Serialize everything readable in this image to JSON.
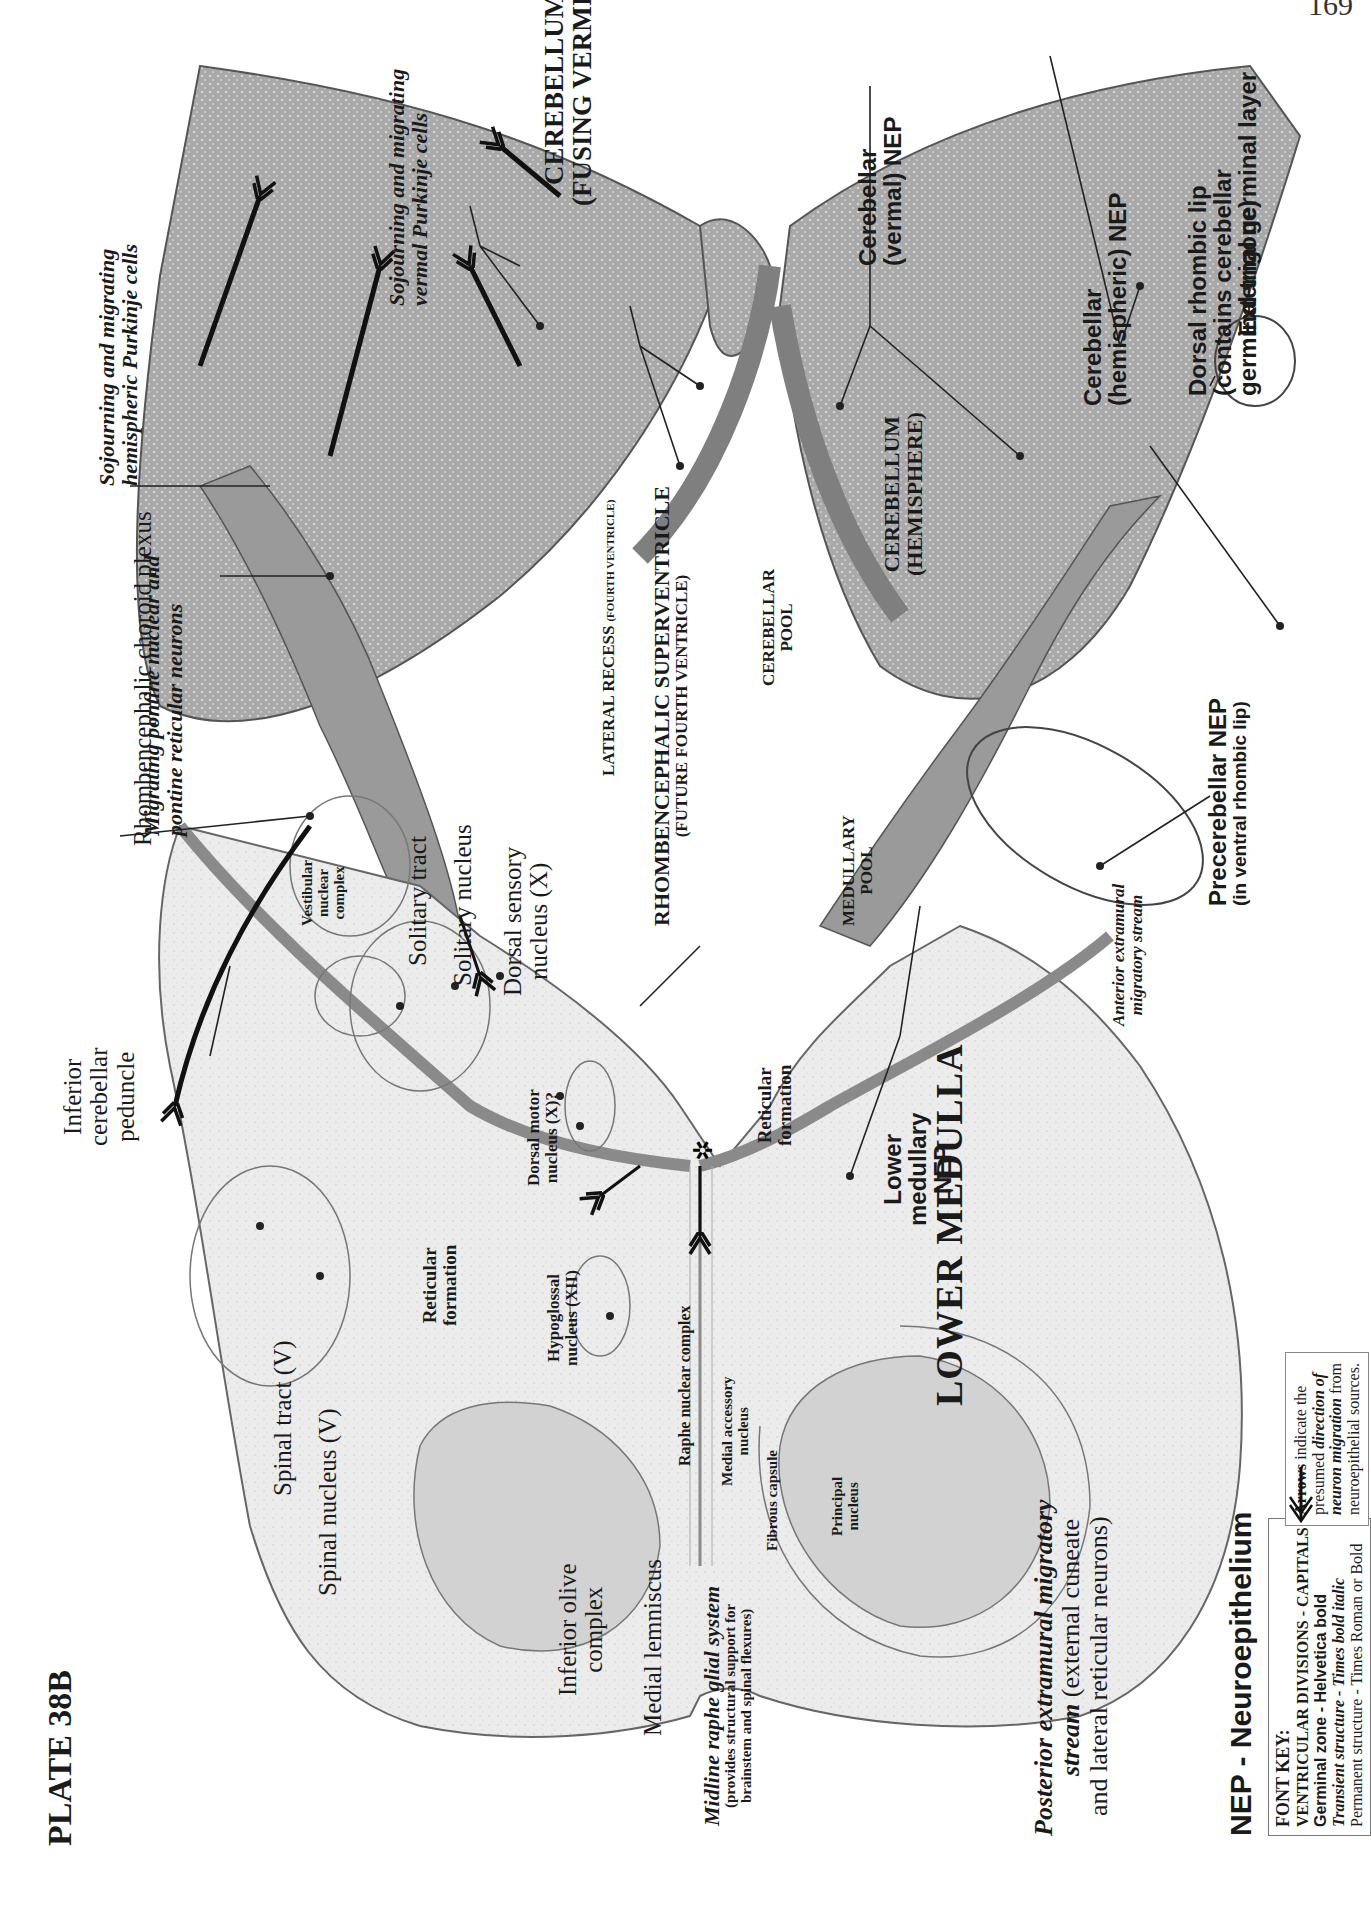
{
  "page": {
    "page_number": "169",
    "plate_title": "PLATE 38B"
  },
  "regions": {
    "cerebellum_vermis": [
      "CEREBELLUM",
      "(FUSING VERMIS)"
    ],
    "cerebellum_hemisphere": [
      "CEREBELLUM",
      "(HEMISPHERE)"
    ],
    "supraventricle": [
      "RHOMBENCEPHALIC SUPERVENTRICLE",
      "(FUTURE FOURTH VENTRICLE)"
    ],
    "lateral_recess": {
      "main": "LATERAL RECESS",
      "sub": "(FOURTH VENTRICLE)"
    },
    "cerebellar_pool": [
      "CEREBELLAR",
      "POOL"
    ],
    "medullary_pool": [
      "MEDULLARY",
      "POOL"
    ],
    "lower_medulla": "LOWER MEDULLA"
  },
  "germinal_labels": {
    "cerebellar_vermal_nep": [
      "Cerebellar",
      "(vermal) NEP"
    ],
    "external_germinal_layer": "External germinal layer",
    "cerebellar_hemispheric_nep": [
      "Cerebellar",
      "(hemispheric) NEP"
    ],
    "dorsal_rhombic_lip": [
      "Dorsal rhombic lip",
      "(contains cerebellar",
      "germinal trigone)"
    ],
    "precerebellar_nep": [
      "Precerebellar NEP",
      "(in ventral rhombic lip)"
    ],
    "lower_medullary_nep": [
      "Lower",
      "medullary",
      "NEP"
    ],
    "nep_legend": "NEP - Neuroepithelium"
  },
  "transient_labels": {
    "vermal_purkinje": [
      "Sojourning and migrating",
      "vermal Purkinje cells"
    ],
    "hemispheric_purkinje": [
      "Sojourning and migrating",
      "hemispheric Purkinje cells"
    ],
    "migrating_pontine": [
      "Migrating pontine nuclear and",
      "pontine reticular neurons"
    ],
    "midline_raphe": {
      "title": "Midline raphe glial system",
      "lines": [
        "(provides structural support for",
        "brainstem and spinal flexures)"
      ]
    },
    "anterior_extramural": [
      "Anterior extramural",
      "migratory stream"
    ],
    "posterior_extramural": {
      "title": "Posterior extramural migratory",
      "title2": "stream",
      "rest": " (external cuneate",
      "line3": "and lateral reticular neurons)"
    }
  },
  "permanent_labels": {
    "choroid_plexus": "Rhombencephalic choroid plexus",
    "solitary_tract": "Solitary tract",
    "solitary_nucleus": "Solitary nucleus",
    "dorsal_sensory": [
      "Dorsal sensory",
      "nucleus (X)"
    ],
    "inferior_cerebellar_peduncle": [
      "Inferior",
      "cerebellar",
      "peduncle"
    ],
    "spinal_tract": "Spinal tract (V)",
    "spinal_nucleus": "Spinal nucleus (V)",
    "inferior_olive": [
      "Inferior olive",
      "complex"
    ],
    "medial_lemniscus": "Medial lemniscus",
    "vestibular": [
      "Vestibular",
      "nuclear",
      "complex"
    ],
    "dorsal_motor": [
      "Dorsal motor",
      "nucleus (X)?"
    ],
    "hypoglossal": [
      "Hypoglossal",
      "nucleus (XII)"
    ],
    "reticular_left": [
      "Reticular",
      "formation"
    ],
    "reticular_right": [
      "Reticular",
      "formation"
    ],
    "raphe_nuclear": "Raphe nuclear complex",
    "medial_accessory": [
      "Medial accessory",
      "nucleus"
    ],
    "fibrous_capsule": "Fibrous capsule",
    "principal_nucleus": [
      "Principal",
      "nucleus"
    ]
  },
  "font_key": {
    "title": "FONT KEY:",
    "lines": [
      "VENTRICULAR DIVISIONS - CAPITALS",
      "Germinal zone - Helvetica bold",
      "Transient structure - Times bold italic",
      "Permanent structure - Times Roman or Bold"
    ]
  },
  "arrow_legend": {
    "bold_word": "Arrows",
    "text1": " indicate the",
    "text2": "presumed ",
    "italic1": "direction of",
    "italic2": "neuron migration",
    "text3": " from",
    "text4": "neuroepithelial sources."
  },
  "colors": {
    "tissue_light": "#e4e4e4",
    "tissue_mid": "#b3b3b3",
    "tissue_dark": "#8f8f8f",
    "outline": "#555555",
    "leader": "#222222"
  }
}
